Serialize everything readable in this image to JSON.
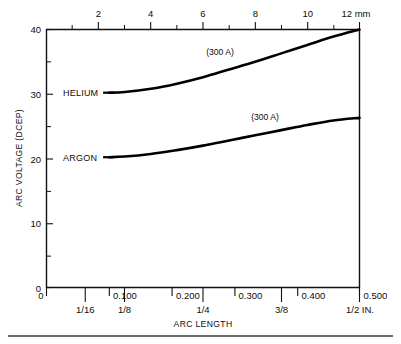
{
  "figure": {
    "background_color": "#ffffff",
    "ink_color": "#0d0d0d",
    "curve_color": "#000000"
  },
  "chart_data": {
    "type": "line",
    "title": "",
    "xlabel": "ARC LENGTH",
    "ylabel": "ARC VOLTAGE (DCEP)",
    "grid": false,
    "legend_position": "inline-left-of-curve",
    "x_axis_top": {
      "label": "",
      "unit": "mm",
      "unit_label": "12 mm",
      "range": [
        0,
        12
      ],
      "major_ticks": [
        2,
        4,
        6,
        8,
        10,
        12
      ],
      "major_tick_labels": [
        "2",
        "4",
        "6",
        "8",
        "10",
        "12"
      ],
      "minor_ticks": [
        1,
        3,
        5,
        7,
        9,
        11
      ]
    },
    "x_axis_bottom": {
      "label": "ARC LENGTH",
      "unit": "IN.",
      "range": [
        0,
        0.5
      ],
      "decimal_ticks": [
        0,
        0.1,
        0.2,
        0.3,
        0.4,
        0.5
      ],
      "decimal_tick_labels": [
        "0",
        "0.100",
        "0.200",
        "0.300",
        "0.400",
        "0.500"
      ],
      "fraction_ticks": [
        0.0625,
        0.125,
        0.25,
        0.375,
        0.5
      ],
      "fraction_tick_labels": [
        "1/16",
        "1/8",
        "1/4",
        "3/8",
        "1/2 IN."
      ]
    },
    "y_axis": {
      "label": "ARC VOLTAGE (DCEP)",
      "range": [
        0,
        40
      ],
      "major_ticks": [
        0,
        10,
        20,
        30,
        40
      ],
      "major_tick_labels": [
        "0",
        "10",
        "20",
        "30",
        "40"
      ],
      "minor_ticks": [
        5,
        15,
        25,
        35
      ]
    },
    "series": [
      {
        "name": "HELIUM",
        "label": "HELIUM",
        "annotation": "(300 A)",
        "current_amps": 300,
        "x_unit": "mm",
        "y_unit": "V",
        "x": [
          2.4,
          3.0,
          4.0,
          5.0,
          6.0,
          7.0,
          8.0,
          9.0,
          10.0,
          11.0,
          12.0
        ],
        "values": [
          30.2,
          30.3,
          30.8,
          31.6,
          32.6,
          33.8,
          35.0,
          36.3,
          37.6,
          38.9,
          40.0
        ]
      },
      {
        "name": "ARGON",
        "label": "ARGON",
        "annotation": "(300 A)",
        "current_amps": 300,
        "x_unit": "mm",
        "y_unit": "V",
        "x": [
          2.4,
          3.0,
          4.0,
          5.0,
          6.0,
          7.0,
          8.0,
          9.0,
          10.0,
          11.0,
          12.0
        ],
        "values": [
          20.2,
          20.3,
          20.7,
          21.3,
          22.0,
          22.8,
          23.6,
          24.4,
          25.2,
          25.9,
          26.3
        ]
      }
    ]
  }
}
